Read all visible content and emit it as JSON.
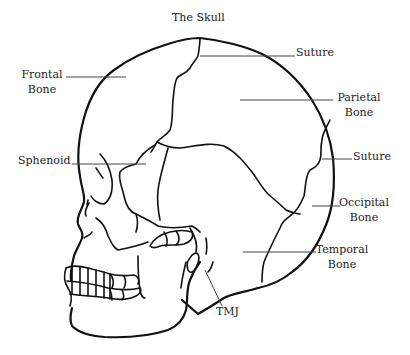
{
  "title": "The Skull",
  "labels": {
    "frontal": {
      "line1": "Frontal",
      "line2": "Bone"
    },
    "suture_top": "Suture",
    "parietal": {
      "line1": "Parietal",
      "line2": "Bone"
    },
    "sphenoid": "Sphenoid",
    "suture_back": "Suture",
    "occipital": {
      "line1": "Occipital",
      "line2": "Bone"
    },
    "temporal": {
      "line1": "Temporal",
      "line2": "Bone"
    },
    "tmj": "TMJ"
  },
  "colors": {
    "line": "#111111",
    "leader": "#444444",
    "text": "#222222",
    "background": "#ffffff"
  }
}
